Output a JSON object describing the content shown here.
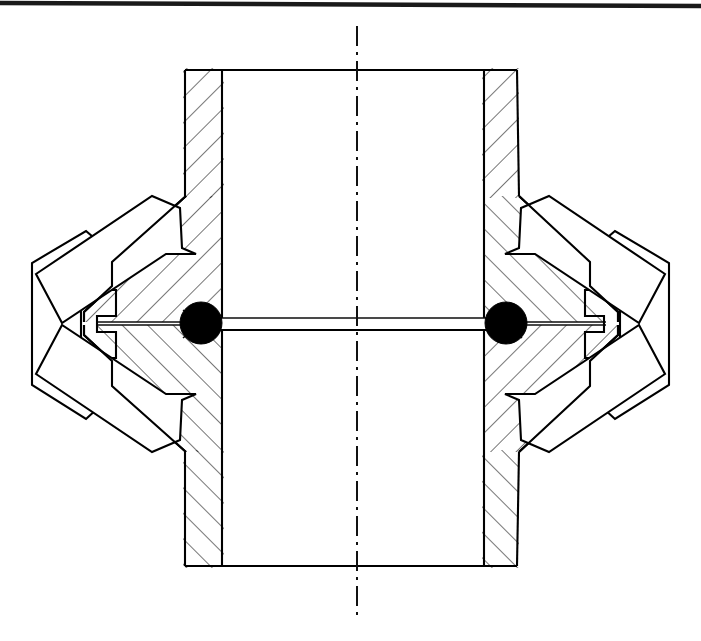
{
  "figure": {
    "background_color": "#ffffff",
    "line_color": "#000000",
    "hatch_color": "#111111",
    "ball_color": "#000000",
    "canvas": {
      "width": 701,
      "height": 641
    }
  },
  "page_edge": {
    "name": "scan-edge-top",
    "x1": 0,
    "y1": 3,
    "x2": 701,
    "y2": 6,
    "stroke_width": 4.5,
    "color": "#1a1a1a"
  },
  "centerline": {
    "name": "vertical-axis-centerline",
    "x": 357,
    "y_top": 26,
    "y_bottom": 620,
    "pattern": "dash-dot",
    "dasharray": "20 6 3 6"
  },
  "tube": {
    "name": "central-tube",
    "outer_left": 185,
    "inner_left": 222,
    "inner_right": 484,
    "outer_right": 517,
    "top": 70,
    "bottom": 566,
    "wall_hatch_angle_deg": 45
  },
  "balls": [
    {
      "name": "sealing-ball-left",
      "cx": 201,
      "cy": 323,
      "r": 21
    },
    {
      "name": "sealing-ball-right",
      "cx": 506,
      "cy": 323,
      "r": 21
    }
  ],
  "bore_slot": {
    "name": "central-bore-slot",
    "x_left": 201,
    "x_right": 506,
    "y_top": 318,
    "y_bottom": 330
  },
  "flanges": [
    {
      "name": "conical-flange-left",
      "side": "left",
      "apex_x": 80,
      "apex_y": 323,
      "root_x": 222,
      "top_y": 196,
      "bottom_y": 452
    },
    {
      "name": "conical-flange-right",
      "side": "right",
      "apex_x": 621,
      "apex_y": 323,
      "root_x": 484,
      "top_y": 196,
      "bottom_y": 452
    }
  ],
  "clamp_bodies": [
    {
      "name": "clamp-body-left",
      "side": "left",
      "outer_x": 32,
      "top_y": 231,
      "bottom_y": 417
    },
    {
      "name": "clamp-body-right",
      "side": "right",
      "outer_x": 669,
      "top_y": 231,
      "bottom_y": 417
    }
  ],
  "jaws": [
    {
      "name": "clamping-jaw-upper-left",
      "position": "upper-left",
      "angle_deg": -35
    },
    {
      "name": "clamping-jaw-lower-left",
      "position": "lower-left",
      "angle_deg": 35
    },
    {
      "name": "clamping-jaw-upper-right",
      "position": "upper-right",
      "angle_deg": 35
    },
    {
      "name": "clamping-jaw-lower-right",
      "position": "lower-right",
      "angle_deg": -35
    }
  ],
  "slots": [
    {
      "name": "t-slot-left",
      "side": "left",
      "x_outer": 81,
      "x_inner": 116,
      "y_top": 290,
      "y_bottom": 358
    },
    {
      "name": "t-slot-right",
      "side": "right",
      "x_outer": 620,
      "x_inner": 585,
      "y_top": 290,
      "y_bottom": 358
    }
  ],
  "hatching": {
    "spacing_px": 18,
    "angle_deg": 45,
    "stroke_width": 1.15
  }
}
